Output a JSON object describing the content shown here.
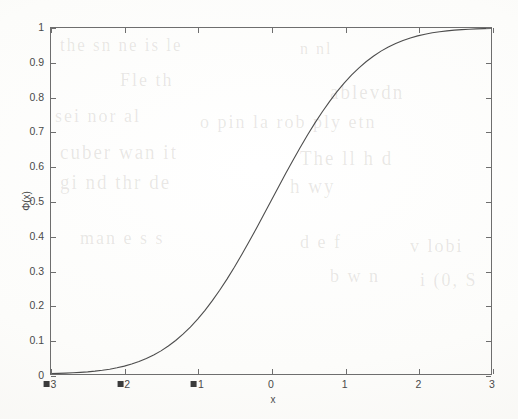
{
  "chart_data": {
    "type": "line",
    "title": "",
    "xlabel": "x",
    "ylabel": "Φ(x)",
    "xlim": [
      -3,
      3
    ],
    "ylim": [
      0,
      1
    ],
    "grid": false,
    "legend": null,
    "x_ticks": [
      -3,
      -2,
      -1,
      0,
      1,
      2,
      3
    ],
    "x_tick_labels": [
      "-3",
      "-2",
      "-1",
      "0",
      "1",
      "2",
      "3"
    ],
    "y_ticks": [
      0,
      0.1,
      0.2,
      0.3,
      0.4,
      0.5,
      0.6,
      0.7,
      0.8,
      0.9,
      1
    ],
    "y_tick_labels": [
      "0",
      "0.1",
      "0.2",
      "0.3",
      "0.4",
      "0.5",
      "0.6",
      "0.7",
      "0.8",
      "0.9",
      "1"
    ],
    "series": [
      {
        "name": "Φ(x)",
        "color": "#4d4d4d",
        "x": [
          -3.0,
          -2.9,
          -2.8,
          -2.7,
          -2.6,
          -2.5,
          -2.4,
          -2.3,
          -2.2,
          -2.1,
          -2.0,
          -1.9,
          -1.8,
          -1.7,
          -1.6,
          -1.5,
          -1.4,
          -1.3,
          -1.2,
          -1.1,
          -1.0,
          -0.9,
          -0.8,
          -0.7,
          -0.6,
          -0.5,
          -0.4,
          -0.3,
          -0.2,
          -0.1,
          0.0,
          0.1,
          0.2,
          0.3,
          0.4,
          0.5,
          0.6,
          0.7,
          0.8,
          0.9,
          1.0,
          1.1,
          1.2,
          1.3,
          1.4,
          1.5,
          1.6,
          1.7,
          1.8,
          1.9,
          2.0,
          2.1,
          2.2,
          2.3,
          2.4,
          2.5,
          2.6,
          2.7,
          2.8,
          2.9,
          3.0
        ],
        "values": [
          0.0013,
          0.0019,
          0.0026,
          0.0035,
          0.0047,
          0.0062,
          0.0082,
          0.0107,
          0.0139,
          0.0179,
          0.0228,
          0.0287,
          0.0359,
          0.0446,
          0.0548,
          0.0668,
          0.0808,
          0.0968,
          0.1151,
          0.1357,
          0.1587,
          0.1841,
          0.2119,
          0.242,
          0.2743,
          0.3085,
          0.3446,
          0.3821,
          0.4207,
          0.4602,
          0.5,
          0.5398,
          0.5793,
          0.6179,
          0.6554,
          0.6915,
          0.7257,
          0.758,
          0.7881,
          0.8159,
          0.8413,
          0.8643,
          0.8849,
          0.9032,
          0.9192,
          0.9332,
          0.9452,
          0.9554,
          0.9641,
          0.9713,
          0.9772,
          0.9821,
          0.9861,
          0.9893,
          0.9918,
          0.9938,
          0.9953,
          0.9965,
          0.9974,
          0.9981,
          0.9987
        ]
      }
    ]
  },
  "axes": {
    "border_color": "#6e6e6e",
    "tick_color": "#6e6e6e",
    "label_color": "#4a4a4a"
  },
  "background": {
    "bleed_lines": [
      {
        "text": "the sn ne is le",
        "x": 60,
        "y": 36,
        "size": 17
      },
      {
        "text": "n nl",
        "x": 300,
        "y": 40,
        "size": 16
      },
      {
        "text": "Fle th",
        "x": 120,
        "y": 70,
        "size": 18
      },
      {
        "text": "ablevdn",
        "x": 330,
        "y": 82,
        "size": 19
      },
      {
        "text": "sei nor al",
        "x": 55,
        "y": 106,
        "size": 18
      },
      {
        "text": "o pin la rob ply etn",
        "x": 200,
        "y": 112,
        "size": 18
      },
      {
        "text": "cuber wan it",
        "x": 60,
        "y": 142,
        "size": 19
      },
      {
        "text": "The ll h d",
        "x": 300,
        "y": 148,
        "size": 19
      },
      {
        "text": "gi nd thr de",
        "x": 60,
        "y": 172,
        "size": 19
      },
      {
        "text": "h wy",
        "x": 290,
        "y": 176,
        "size": 19
      },
      {
        "text": "man e s s",
        "x": 80,
        "y": 228,
        "size": 18
      },
      {
        "text": "d e f",
        "x": 300,
        "y": 232,
        "size": 18
      },
      {
        "text": "v lobi",
        "x": 410,
        "y": 236,
        "size": 18
      },
      {
        "text": "b w n",
        "x": 330,
        "y": 266,
        "size": 18
      },
      {
        "text": "i (0, S",
        "x": 420,
        "y": 270,
        "size": 18
      }
    ]
  }
}
